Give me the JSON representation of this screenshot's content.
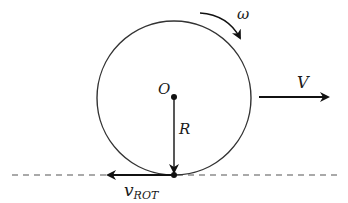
{
  "diagram": {
    "labels": {
      "omega": "ω",
      "center": "O",
      "radius": "R",
      "velocity": "V",
      "v_rot_main": "v",
      "v_rot_sub": "ROT"
    },
    "colors": {
      "stroke": "#333333",
      "arrow": "#111111",
      "ground": "#555555",
      "background": "#ffffff"
    }
  }
}
